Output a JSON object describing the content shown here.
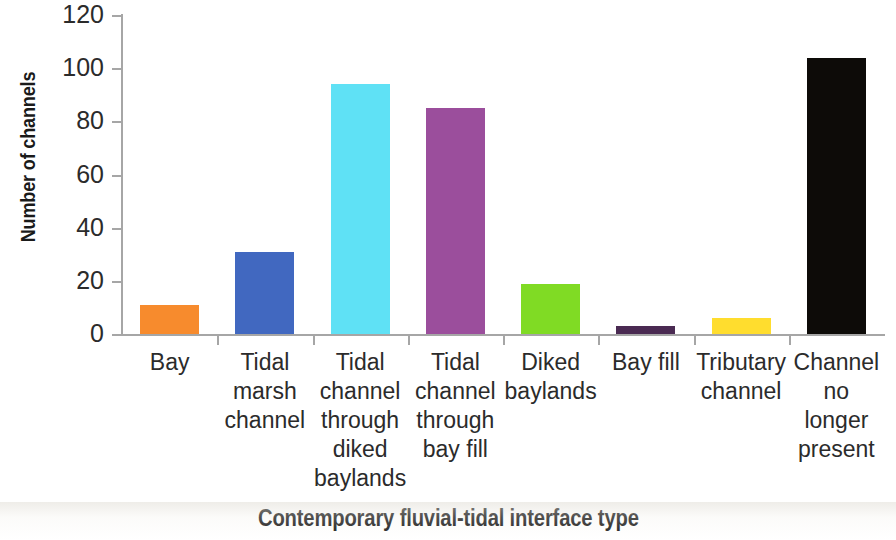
{
  "chart_data": {
    "type": "bar",
    "title": "",
    "xlabel": "Contemporary fluvial-tidal interface type",
    "ylabel": "Number of channels",
    "categories": [
      "Bay",
      "Tidal marsh channel",
      "Tidal channel through diked baylands",
      "Tidal channel through bay fill",
      "Diked baylands",
      "Bay fill",
      "Tributary channel",
      "Channel no longer present"
    ],
    "category_label_lines": [
      [
        "Bay"
      ],
      [
        "Tidal",
        "marsh",
        "channel"
      ],
      [
        "Tidal",
        "channel",
        "through",
        "diked",
        "baylands"
      ],
      [
        "Tidal",
        "channel",
        "through",
        "bay fill"
      ],
      [
        "Diked",
        "baylands"
      ],
      [
        "Bay fill"
      ],
      [
        "Tributary",
        "channel"
      ],
      [
        "Channel",
        "no",
        "longer",
        "present"
      ]
    ],
    "values": [
      11,
      31,
      94,
      85,
      19,
      3,
      6,
      104
    ],
    "colors": [
      "#F78B2D",
      "#4168C0",
      "#5FE1F5",
      "#9B4E9C",
      "#80DB24",
      "#4A2A52",
      "#FFDD2E",
      "#0D0B08"
    ],
    "ylim": [
      0,
      120
    ],
    "yticks": [
      0,
      20,
      40,
      60,
      80,
      100,
      120
    ],
    "ytick_labels": [
      "0",
      "20",
      "40",
      "60",
      "80",
      "100",
      "120"
    ],
    "grid": false,
    "legend": "none"
  }
}
